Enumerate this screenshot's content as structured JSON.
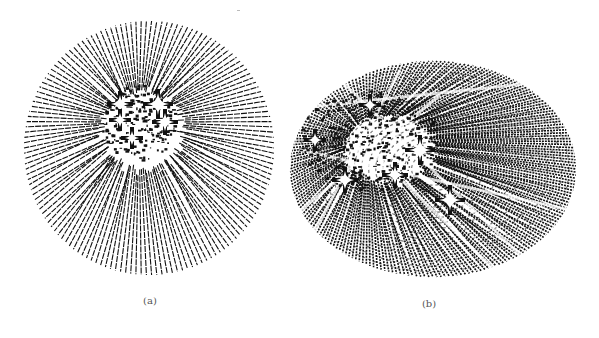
{
  "figure": {
    "panels": [
      {
        "id": "a",
        "caption": "(a)",
        "caption_pos": [
          131,
          295
        ],
        "shape": "circle",
        "center": [
          149,
          148
        ],
        "rx": 125,
        "ry": 127,
        "line_count": 150,
        "stroke": "#111111",
        "core": [
          139,
          122
        ],
        "core_radius": 38,
        "stars": [
          [
            132,
            138
          ],
          [
            120,
            104
          ],
          [
            158,
            104
          ],
          [
            120,
            120
          ],
          [
            165,
            122
          ]
        ]
      },
      {
        "id": "b",
        "caption": "(b)",
        "caption_pos": [
          409,
          298
        ],
        "shape": "ellipse",
        "center": [
          433,
          169
        ],
        "rx": 143,
        "ry": 108,
        "line_count": 220,
        "stroke": "#111111",
        "core": [
          368,
          140
        ],
        "core_radius": 50,
        "stars": [
          [
            370,
            105
          ],
          [
            345,
            180
          ],
          [
            420,
            150
          ],
          [
            315,
            140
          ],
          [
            395,
            175
          ],
          [
            450,
            200
          ]
        ]
      }
    ],
    "background": "#ffffff"
  }
}
